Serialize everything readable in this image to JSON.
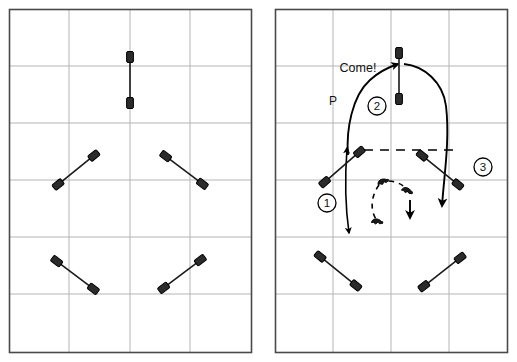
{
  "figure": {
    "type": "dog-agility-course-diagram",
    "panel_count": 2,
    "background_color": "#ffffff",
    "border_color": "#4a4a4a",
    "grid_color": "#b5b5b5",
    "obstacle_color": "#1a1a1a",
    "path_color": "#000000"
  },
  "panels": [
    {
      "id": "left-panel",
      "name": "course-layout",
      "frame": {
        "x": 9,
        "y": 9,
        "width": 243,
        "height": 344
      },
      "grid": {
        "columns": 4,
        "rows": 6,
        "vertical_lines": [
          69,
          130,
          190
        ],
        "horizontal_lines": [
          66,
          123,
          180,
          237,
          294
        ]
      },
      "obstacles": [
        {
          "name": "jump-top-center",
          "x1": 130,
          "y1": 52,
          "x2": 130,
          "y2": 108,
          "angle": 90
        },
        {
          "name": "jump-mid-left",
          "x1": 53,
          "y1": 189,
          "x2": 100,
          "y2": 151,
          "angle": 39
        },
        {
          "name": "jump-mid-right",
          "x1": 160,
          "y1": 152,
          "x2": 207,
          "y2": 188,
          "angle": -37
        },
        {
          "name": "jump-low-left",
          "x1": 51,
          "y1": 257,
          "x2": 98,
          "y2": 293,
          "angle": -37
        },
        {
          "name": "jump-low-right",
          "x1": 158,
          "y1": 292,
          "x2": 205,
          "y2": 256,
          "angle": 37
        }
      ]
    },
    {
      "id": "right-panel",
      "name": "handling-path-diagram",
      "frame": {
        "x": 275,
        "y": 9,
        "width": 233,
        "height": 344
      },
      "grid": {
        "columns": 4,
        "rows": 6,
        "vertical_lines": [
          333,
          391,
          449
        ],
        "horizontal_lines": [
          66,
          123,
          180,
          237,
          294
        ]
      },
      "obstacles": [
        {
          "name": "jump-top-center",
          "x1": 399,
          "y1": 47,
          "x2": 399,
          "y2": 104,
          "angle": 90
        },
        {
          "name": "jump-mid-left",
          "x1": 320,
          "y1": 185,
          "x2": 363,
          "y2": 148,
          "angle": 41
        },
        {
          "name": "jump-mid-right",
          "x1": 417,
          "y1": 152,
          "x2": 462,
          "y2": 188,
          "angle": -39
        },
        {
          "name": "jump-low-left",
          "x1": 314,
          "y1": 252,
          "x2": 361,
          "y2": 290,
          "angle": -39
        },
        {
          "name": "jump-low-right",
          "x1": 418,
          "y1": 290,
          "x2": 465,
          "y2": 253,
          "angle": 38
        }
      ],
      "labels": [
        {
          "name": "come-cue-label",
          "text": "Come!",
          "x": 358,
          "y": 72
        },
        {
          "name": "handler-position-label",
          "text": "P",
          "x": 333,
          "y": 105
        }
      ],
      "markers": [
        {
          "name": "step-marker-1",
          "text": "1",
          "cx": 327,
          "cy": 203,
          "r": 9
        },
        {
          "name": "step-marker-2",
          "text": "2",
          "cx": 377,
          "cy": 106,
          "r": 9
        },
        {
          "name": "step-marker-3",
          "text": "3",
          "cx": 483,
          "cy": 167,
          "r": 9
        }
      ],
      "paths": [
        {
          "name": "dog-path",
          "style": "solid",
          "description": "dog route up over jump 1, around the top jump, back down past jump 3"
        },
        {
          "name": "handler-path",
          "style": "solid",
          "description": "handler near-vertical line with arrows at both ends"
        },
        {
          "name": "handler-turn-path",
          "style": "dashed",
          "description": "dashed curve showing the handler's rotation in the pocket"
        },
        {
          "name": "jump-connector",
          "style": "dashed",
          "description": "dashed horizontal line linking jump 1 and jump 3 wing tips"
        }
      ],
      "handler_icons": [
        {
          "name": "handler-icon-upper-left",
          "x": 383,
          "y": 182
        },
        {
          "name": "handler-icon-lower-left",
          "x": 377,
          "y": 222
        },
        {
          "name": "handler-icon-right",
          "x": 408,
          "y": 192
        }
      ]
    }
  ]
}
